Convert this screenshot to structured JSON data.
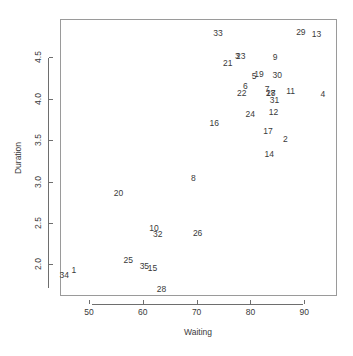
{
  "chart_data": {
    "type": "scatter",
    "title": "",
    "xlabel": "Waiting",
    "ylabel": "Duration",
    "xlim": [
      44.6,
      96.1
    ],
    "ylim": [
      1.62,
      4.96
    ],
    "xticks": [
      50,
      60,
      70,
      80,
      90
    ],
    "yticks": [
      2.0,
      2.5,
      3.0,
      3.5,
      4.0,
      4.5
    ],
    "xtick_labels": [
      "50",
      "60",
      "70",
      "80",
      "90"
    ],
    "ytick_labels": [
      "2.0",
      "2.5",
      "3.0",
      "3.5",
      "4.0",
      "4.5"
    ],
    "grid": false,
    "legend": null,
    "marker_style": "text-labels",
    "points": [
      {
        "label": "1",
        "x": 47.0,
        "y": 1.95
      },
      {
        "label": "2",
        "x": 86.3,
        "y": 3.52
      },
      {
        "label": "3",
        "x": 77.4,
        "y": 4.52
      },
      {
        "label": "4",
        "x": 93.3,
        "y": 4.07
      },
      {
        "label": "5",
        "x": 80.5,
        "y": 4.29
      },
      {
        "label": "6",
        "x": 78.9,
        "y": 4.17
      },
      {
        "label": "7",
        "x": 82.9,
        "y": 4.13
      },
      {
        "label": "8",
        "x": 69.2,
        "y": 3.05
      },
      {
        "label": "9",
        "x": 84.4,
        "y": 4.51
      },
      {
        "label": "10",
        "x": 61.9,
        "y": 2.45
      },
      {
        "label": "11",
        "x": 87.3,
        "y": 4.1
      },
      {
        "label": "12",
        "x": 84.1,
        "y": 3.85
      },
      {
        "label": "13",
        "x": 92.1,
        "y": 4.79
      },
      {
        "label": "14",
        "x": 83.3,
        "y": 3.34
      },
      {
        "label": "15",
        "x": 61.6,
        "y": 1.97
      },
      {
        "label": "16",
        "x": 73.1,
        "y": 3.72
      },
      {
        "label": "17",
        "x": 83.1,
        "y": 3.62
      },
      {
        "label": "18",
        "x": 83.6,
        "y": 4.08
      },
      {
        "label": "19",
        "x": 81.4,
        "y": 4.31
      },
      {
        "label": "20",
        "x": 55.3,
        "y": 2.87
      },
      {
        "label": "21",
        "x": 75.6,
        "y": 4.44
      },
      {
        "label": "22",
        "x": 78.2,
        "y": 4.08
      },
      {
        "label": "23",
        "x": 78.0,
        "y": 4.52
      },
      {
        "label": "24",
        "x": 79.8,
        "y": 3.83
      },
      {
        "label": "25",
        "x": 57.1,
        "y": 2.07
      },
      {
        "label": "26",
        "x": 70.0,
        "y": 2.39
      },
      {
        "label": "27",
        "x": 83.6,
        "y": 4.08
      },
      {
        "label": "28",
        "x": 63.3,
        "y": 1.72
      },
      {
        "label": "29",
        "x": 89.2,
        "y": 4.82
      },
      {
        "label": "30",
        "x": 84.8,
        "y": 4.3
      },
      {
        "label": "31",
        "x": 84.3,
        "y": 4.0
      },
      {
        "label": "32",
        "x": 62.6,
        "y": 2.38
      },
      {
        "label": "33",
        "x": 73.8,
        "y": 4.8
      },
      {
        "label": "34",
        "x": 45.2,
        "y": 1.88
      },
      {
        "label": "35",
        "x": 60.1,
        "y": 1.99
      }
    ]
  }
}
